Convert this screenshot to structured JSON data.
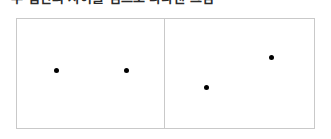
{
  "caption": {
    "text": "두 집단의 차이를 점으로 나타낸 그림"
  },
  "figure": {
    "name": "two-panel-dot-diagram",
    "border_color": "#c9c9c9",
    "background_color": "#ffffff",
    "dot_color": "#000000",
    "panels": [
      {
        "id": "left",
        "label": "left-panel",
        "dots": [
          {
            "label": "dot-left-1",
            "x": 39,
            "y": 51
          },
          {
            "label": "dot-left-2",
            "x": 109,
            "y": 51
          }
        ]
      },
      {
        "id": "right",
        "label": "right-panel",
        "dots": [
          {
            "label": "dot-right-1",
            "x": 41,
            "y": 68
          },
          {
            "label": "dot-right-2",
            "x": 106,
            "y": 38
          }
        ]
      }
    ]
  }
}
